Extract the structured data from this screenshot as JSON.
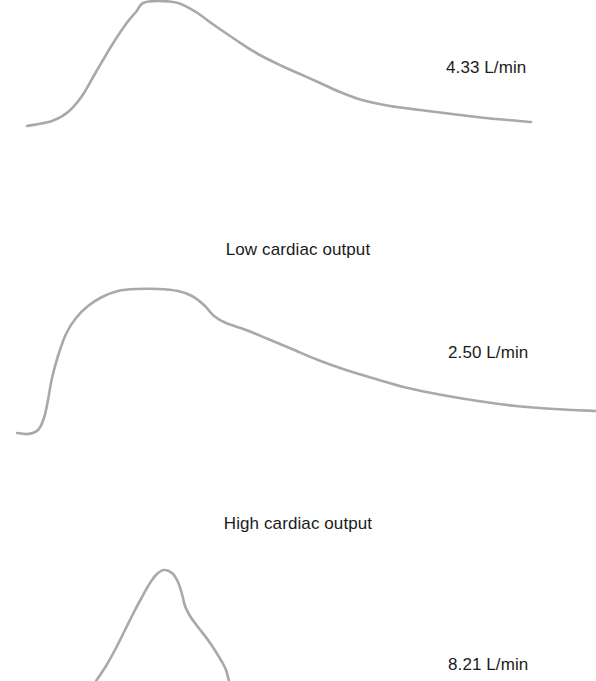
{
  "figure": {
    "background_color": "#ffffff",
    "trace_color": "#a9a9a9",
    "text_color": "#1b1b1b"
  },
  "panels": {
    "normal": {
      "heading": "",
      "value_label": "4.33 L/min"
    },
    "low": {
      "heading": "Low cardiac output",
      "value_label": "2.50 L/min"
    },
    "high": {
      "heading": "High cardiac output",
      "value_label": "8.21 L/min"
    }
  },
  "chart_data": {
    "type": "line",
    "title": "",
    "xlabel": "",
    "ylabel": "",
    "grid": false,
    "legend": "none",
    "series": [
      {
        "name": "Normal cardiac output",
        "value": 4.33,
        "unit": "L/min",
        "annotation": "4.33 L/min",
        "peak_shape": "moderate plateau, clipped at top of panel",
        "points": [
          [
            27,
            126
          ],
          [
            52,
            121
          ],
          [
            68,
            112
          ],
          [
            82,
            96
          ],
          [
            96,
            72
          ],
          [
            112,
            45
          ],
          [
            126,
            24
          ],
          [
            136,
            12
          ],
          [
            143,
            3
          ],
          [
            158,
            1
          ],
          [
            178,
            3
          ],
          [
            196,
            12
          ],
          [
            214,
            25
          ],
          [
            236,
            40
          ],
          [
            258,
            54
          ],
          [
            282,
            66
          ],
          [
            300,
            74
          ],
          [
            318,
            82
          ],
          [
            340,
            92
          ],
          [
            362,
            100
          ],
          [
            390,
            106
          ],
          [
            420,
            110
          ],
          [
            452,
            114
          ],
          [
            486,
            118
          ],
          [
            531,
            122
          ]
        ]
      },
      {
        "name": "Low cardiac output",
        "value": 2.5,
        "unit": "L/min",
        "annotation": "2.50 L/min",
        "peak_shape": "broad rounded plateau with long slow decay",
        "points": [
          [
            17,
            433
          ],
          [
            28,
            434
          ],
          [
            38,
            430
          ],
          [
            44,
            418
          ],
          [
            48,
            400
          ],
          [
            52,
            378
          ],
          [
            58,
            356
          ],
          [
            66,
            334
          ],
          [
            76,
            318
          ],
          [
            88,
            306
          ],
          [
            102,
            297
          ],
          [
            118,
            291
          ],
          [
            136,
            289
          ],
          [
            158,
            289
          ],
          [
            178,
            291
          ],
          [
            192,
            296
          ],
          [
            204,
            305
          ],
          [
            214,
            316
          ],
          [
            226,
            323
          ],
          [
            246,
            330
          ],
          [
            268,
            339
          ],
          [
            292,
            349
          ],
          [
            318,
            360
          ],
          [
            346,
            370
          ],
          [
            376,
            379
          ],
          [
            408,
            388
          ],
          [
            442,
            395
          ],
          [
            478,
            401
          ],
          [
            516,
            406
          ],
          [
            554,
            409
          ],
          [
            596,
            411
          ]
        ]
      },
      {
        "name": "High cardiac output",
        "value": 8.21,
        "unit": "L/min",
        "annotation": "8.21 L/min",
        "peak_shape": "tall narrow sharp peak, limbs clipped at bottom of panel",
        "points": [
          [
            96,
            681
          ],
          [
            106,
            666
          ],
          [
            116,
            648
          ],
          [
            126,
            628
          ],
          [
            134,
            612
          ],
          [
            142,
            597
          ],
          [
            150,
            583
          ],
          [
            157,
            574
          ],
          [
            164,
            570
          ],
          [
            172,
            573
          ],
          [
            178,
            582
          ],
          [
            182,
            594
          ],
          [
            185,
            606
          ],
          [
            190,
            616
          ],
          [
            198,
            627
          ],
          [
            208,
            640
          ],
          [
            216,
            652
          ],
          [
            222,
            662
          ],
          [
            226,
            670
          ],
          [
            229,
            681
          ]
        ]
      }
    ]
  }
}
